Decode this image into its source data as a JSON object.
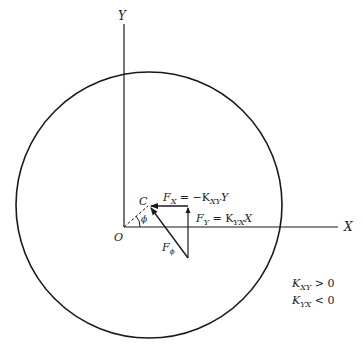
{
  "diagram": {
    "axes": {
      "x_label": "X",
      "y_label": "Y",
      "origin_label": "O"
    },
    "point_label": "C",
    "angle_label": "ϕ",
    "forces": {
      "fx": {
        "base": "F",
        "sub": "X",
        "eq": " = −K",
        "eq_sub": "XY",
        "tail": "Y"
      },
      "fy": {
        "base": "F",
        "sub": "Y",
        "eq": " = K",
        "eq_sub": "YX",
        "tail": "X"
      },
      "fphi": {
        "base": "F",
        "sub": "ϕ"
      }
    },
    "conditions": [
      {
        "base": "K",
        "sub": "XY",
        "rel": " > 0"
      },
      {
        "base": "K",
        "sub": "YX",
        "rel": " < 0"
      }
    ],
    "colors": {
      "stroke": "#1a1a1a",
      "background": "#ffffff"
    }
  }
}
